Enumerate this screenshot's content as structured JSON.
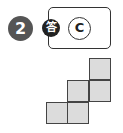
{
  "problem": {
    "number": "2",
    "answer_label": "答",
    "answer_choice": "C"
  },
  "figure": {
    "fill_color": "#dcdcdc",
    "stroke_color": "#444444",
    "squares": [
      {
        "row": 0,
        "col": 2
      },
      {
        "row": 1,
        "col": 1
      },
      {
        "row": 1,
        "col": 2
      },
      {
        "row": 2,
        "col": 0
      },
      {
        "row": 2,
        "col": 1
      }
    ]
  }
}
